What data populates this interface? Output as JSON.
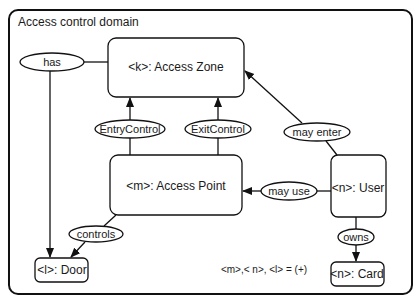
{
  "diagram": {
    "title": "Access control domain",
    "nodes": [
      {
        "id": "zone",
        "label": "<k>: Access Zone"
      },
      {
        "id": "point",
        "label": "<m>: Access Point"
      },
      {
        "id": "user",
        "label": "<n>: User"
      },
      {
        "id": "door",
        "label": "<l>: Door"
      },
      {
        "id": "card",
        "label": "<n>: Card"
      }
    ],
    "relations": [
      {
        "id": "has",
        "label": "has",
        "from": "zone",
        "to": "door"
      },
      {
        "id": "entry",
        "label": "EntryControl",
        "from": "point",
        "to": "zone"
      },
      {
        "id": "exit",
        "label": "ExitControl",
        "from": "point",
        "to": "zone"
      },
      {
        "id": "may_enter",
        "label": "may enter",
        "from": "user",
        "to": "zone"
      },
      {
        "id": "may_use",
        "label": "may use",
        "from": "user",
        "to": "point"
      },
      {
        "id": "controls",
        "label": "controls",
        "from": "point",
        "to": "door"
      },
      {
        "id": "owns",
        "label": "owns",
        "from": "user",
        "to": "card"
      }
    ],
    "note": "<m>,< n>, <l> = (+)"
  }
}
